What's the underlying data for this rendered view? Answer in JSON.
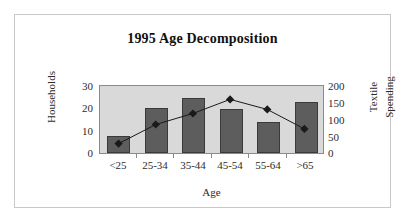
{
  "figure": {
    "border_color": "#c9c9c9",
    "background": "#ffffff"
  },
  "chart_data": {
    "type": "bar",
    "title": "1995 Age Decomposition",
    "xlabel": "Age",
    "categories": [
      "<25",
      "25-34",
      "35-44",
      "45-54",
      "55-64",
      ">65"
    ],
    "grid": false,
    "legend": "none",
    "plot_background": "#d9d9d9",
    "series": [
      {
        "name": "Households",
        "type": "bar",
        "axis": "left",
        "color": "#5d5d5d",
        "values": [
          7.5,
          19.5,
          24,
          19,
          13.5,
          22
        ]
      },
      {
        "name": "Textile Spending",
        "type": "line",
        "axis": "right",
        "color": "#1a1a1a",
        "marker": "diamond",
        "values": [
          28,
          85,
          118,
          160,
          130,
          72
        ]
      }
    ],
    "axes": {
      "left": {
        "title": "Households",
        "ylim": [
          0,
          30
        ],
        "ticks": [
          0,
          10,
          20,
          30
        ],
        "tick_labels": [
          "0",
          "10",
          "20",
          "30"
        ]
      },
      "right": {
        "title_line1": "Textile",
        "title_line2": "Spending",
        "ylim": [
          0,
          200
        ],
        "ticks": [
          0,
          50,
          100,
          150,
          200
        ],
        "tick_labels": [
          "0",
          "50",
          "100",
          "150",
          "200"
        ]
      }
    }
  }
}
